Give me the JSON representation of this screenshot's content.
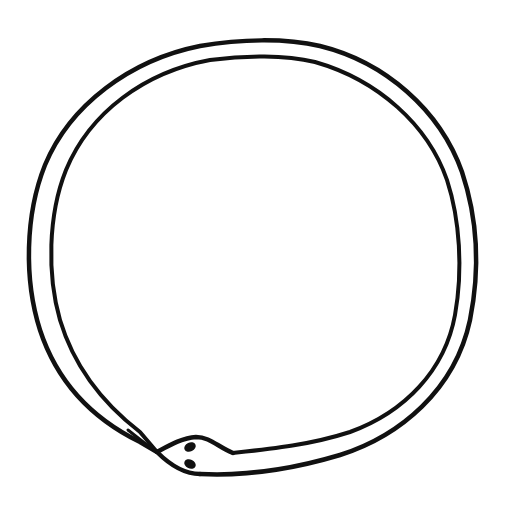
{
  "image": {
    "subject": "Ouroboros line drawing",
    "description": "A snake drawn as a double-line ring swallowing its own tail",
    "background_color": "#ffffff",
    "ink_color": "#111111",
    "stroke_width": 4.5
  },
  "ring": {
    "outer": {
      "cx": 252,
      "cy": 257,
      "rx": 223,
      "ry": 216
    },
    "inner": {
      "cx": 253,
      "cy": 255,
      "rx": 203,
      "ry": 199
    }
  },
  "head": {
    "snout_tip": [
      157,
      452
    ],
    "eyes": [
      {
        "cx": 190,
        "cy": 447,
        "rx": 6,
        "ry": 4.5
      },
      {
        "cx": 190,
        "cy": 464,
        "rx": 6,
        "ry": 4.5
      }
    ]
  }
}
